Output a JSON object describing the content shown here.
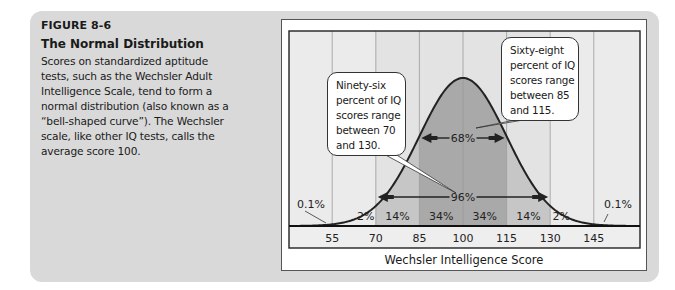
{
  "caption": {
    "figure_number": "FIGURE 8-6",
    "title": "The Normal Distribution",
    "body": "Scores on standardized aptitude tests, such as the Wechsler Adult Intelligence Scale, tend to form a normal distribution (also known as a “bell-shaped curve”). The Wechsler scale, like other IQ tests, calls the average score 100.",
    "body_lines": [
      "Scores on standardized aptitude",
      "tests, such as the Wechsler Adult",
      "Intelligence Scale, tend to form a",
      "normal distribution (also known as a",
      "“bell-shaped curve”). The Wechsler",
      "scale, like other IQ tests, calls the",
      "average score 100."
    ]
  },
  "callouts": {
    "left": {
      "lines": [
        "Ninety-six",
        "percent of IQ",
        "scores range",
        "between 70",
        "and 130."
      ]
    },
    "right": {
      "lines": [
        "Sixty-eight",
        "percent of IQ",
        "scores range",
        "between 85",
        "and 115."
      ]
    }
  },
  "colors": {
    "panel_bg": "#d9d9d9",
    "chart_bg": "#ebebeb",
    "axis_strip_bg": "#eeeeee",
    "band_1sd": "#a9a9a9",
    "band_2sd": "#c6c6c6",
    "band_3sd_bg": "#e3e3e3",
    "gridline": "#9a9a9a",
    "curve": "#222222"
  },
  "chart_data": {
    "type": "area",
    "title": "The Normal Distribution",
    "xlabel": "Wechsler Intelligence Score",
    "ylabel": "",
    "distribution": {
      "mean": 100,
      "sd": 15
    },
    "x_ticks": [
      55,
      70,
      85,
      100,
      115,
      130,
      145
    ],
    "xlim": [
      40,
      160
    ],
    "grid": true,
    "bands": [
      {
        "from": 40,
        "to": 55,
        "label": "0.1%"
      },
      {
        "from": 55,
        "to": 70,
        "label": "2%"
      },
      {
        "from": 70,
        "to": 85,
        "label": "14%"
      },
      {
        "from": 85,
        "to": 100,
        "label": "34%"
      },
      {
        "from": 100,
        "to": 115,
        "label": "34%"
      },
      {
        "from": 115,
        "to": 130,
        "label": "14%"
      },
      {
        "from": 130,
        "to": 145,
        "label": "2%"
      },
      {
        "from": 145,
        "to": 160,
        "label": "0.1%"
      }
    ],
    "range_annotations": [
      {
        "from": 85,
        "to": 115,
        "label": "68%"
      },
      {
        "from": 70,
        "to": 130,
        "label": "96%"
      }
    ]
  }
}
